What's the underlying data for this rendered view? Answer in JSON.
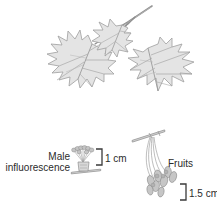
{
  "figure": {
    "background_color": "#ffffff",
    "ink_color": "#8d8d8d",
    "fill_color": "#e4e4e4",
    "text_color": "#2b2b2b"
  },
  "labels": {
    "male_inflorescence": "Male\ninfluorescence",
    "male_inflorescence_line1": "Male",
    "male_inflorescence_line2": "influorescence",
    "fruits": "Fruits",
    "scale_inflorescence": "1 cm",
    "scale_fruits": "1.5 cm"
  },
  "parts": [
    {
      "name": "leafy-twig",
      "description": "Twig bearing two palmately lobed maple leaves",
      "leaf_count": 2
    },
    {
      "name": "male-inflorescence",
      "description": "Cluster of male flowers on short stalks at a bud",
      "scale": "1 cm"
    },
    {
      "name": "fruits",
      "description": "Pendant cluster of paired winged samaras on long pedicels",
      "scale": "1.5 cm"
    }
  ],
  "scale_bars": [
    {
      "name": "scale-bar-1cm",
      "value": "1 cm",
      "shape": "right-bracket"
    },
    {
      "name": "scale-bar-15cm",
      "value": "1.5 cm",
      "shape": "right-bracket"
    }
  ]
}
